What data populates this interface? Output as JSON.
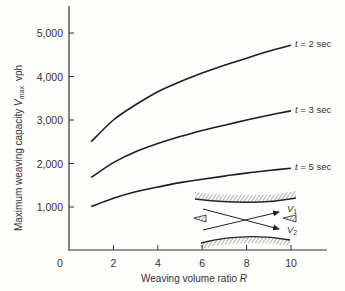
{
  "chart_data": {
    "type": "line",
    "title": "",
    "xlabel": "Weaving volume ratio R",
    "xlabel_text": "Weaving volume ratio ",
    "xlabel_var": "R",
    "ylabel": "Maximum weaving capacity V_max vph",
    "ylabel_text": "Maximum weaving capacity ",
    "ylabel_var": "V",
    "ylabel_sub": "max",
    "ylabel_unit": "vph",
    "xlim": [
      0,
      11.6
    ],
    "ylim": [
      0,
      5500
    ],
    "x_ticks": [
      2,
      4,
      6,
      8,
      10
    ],
    "x_tick_labels": [
      "2",
      "4",
      "6",
      "8",
      "10"
    ],
    "y_ticks": [
      1000,
      2000,
      3000,
      4000,
      5000
    ],
    "y_tick_labels": [
      "1,000",
      "2,000",
      "3,000",
      "4,000",
      "5,000"
    ],
    "origin_label": "0",
    "grid": false,
    "legend": "inline labels at right end of curves",
    "x": [
      1,
      2,
      3,
      4,
      5,
      6,
      7,
      8,
      9,
      10
    ],
    "series": [
      {
        "name": "t = 2 sec",
        "t_var": "t",
        "t_text": " = 2 sec",
        "values": [
          2500,
          3000,
          3350,
          3650,
          3880,
          4080,
          4260,
          4420,
          4580,
          4720
        ]
      },
      {
        "name": "t = 3 sec",
        "t_var": "t",
        "t_text": " = 3 sec",
        "values": [
          1680,
          2020,
          2270,
          2460,
          2620,
          2760,
          2880,
          3000,
          3110,
          3210
        ]
      },
      {
        "name": "t = 5 sec",
        "t_var": "t",
        "t_text": " = 5 sec",
        "values": [
          1010,
          1200,
          1350,
          1460,
          1560,
          1640,
          1710,
          1780,
          1840,
          1890
        ]
      }
    ],
    "annotations": [
      {
        "type": "inset-diagram",
        "description": "weaving section schematic with crossing flows",
        "labels": [
          "V1",
          "V2"
        ]
      }
    ]
  },
  "inset": {
    "v1_var": "V",
    "v1_sub": "1",
    "v2_var": "V",
    "v2_sub": "2"
  }
}
